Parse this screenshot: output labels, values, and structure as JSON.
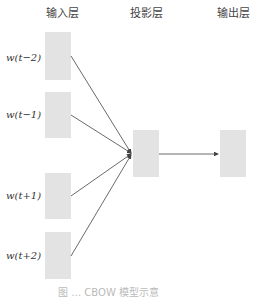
{
  "headers": {
    "input": "输入层",
    "projection": "投影层",
    "output": "输出层"
  },
  "inputs": [
    {
      "label": "w(t−2)"
    },
    {
      "label": "w(t−1)"
    },
    {
      "label": "w(t+1)"
    },
    {
      "label": "w(t+2)"
    }
  ],
  "caption": "图 … CBOW 模型示意",
  "colors": {
    "node": "#e3e3e3",
    "edge": "#444444"
  }
}
